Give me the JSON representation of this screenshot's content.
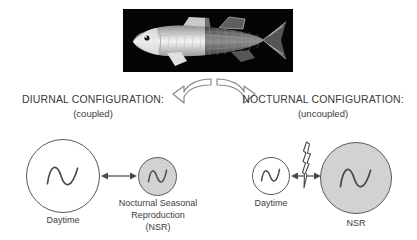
{
  "figure": {
    "photo": {
      "name": "fish-photograph",
      "alt": "Lateral view photograph of a fish on black background, left half lit, right half dark",
      "background_color": "#000000",
      "split": "left half bright (day), right half dark (night)"
    },
    "diverge_arrows": {
      "left_arrow_name": "curved-arrow-left",
      "right_arrow_name": "curved-arrow-right",
      "stroke_color": "#8a8a8a"
    },
    "panels": [
      {
        "id": "diurnal",
        "title": "DIURNAL CONFIGURATION:",
        "subtitle": "(coupled)",
        "coupling": "coupled",
        "oscillators": [
          {
            "id": "daytime",
            "caption": "Daytime",
            "size": "large",
            "fill": "#ffffff",
            "stroke": "#5a5a5a",
            "glyph": "wave"
          },
          {
            "id": "nsr",
            "caption": "Nocturnal Seasonal\nReproduction\n(NSR)",
            "caption_lines": [
              "Nocturnal Seasonal",
              "Reproduction",
              "(NSR)"
            ],
            "size": "small",
            "fill": "#d2d2d2",
            "stroke": "#5a5a5a",
            "glyph": "wave"
          }
        ],
        "connector": {
          "name": "double-headed-arrow",
          "type": "double-headed",
          "interrupted": false
        }
      },
      {
        "id": "nocturnal",
        "title": "NOCTURNAL CONFIGURATION:",
        "subtitle": "(uncoupled)",
        "coupling": "uncoupled",
        "oscillators": [
          {
            "id": "daytime",
            "caption": "Daytime",
            "size": "small",
            "fill": "#ffffff",
            "stroke": "#5a5a5a",
            "glyph": "wave"
          },
          {
            "id": "nsr",
            "caption": "NSR",
            "size": "large",
            "fill": "#d2d2d2",
            "stroke": "#5a5a5a",
            "glyph": "wave"
          }
        ],
        "connector": {
          "name": "broken-double-headed-arrow",
          "type": "double-headed",
          "interrupted": true,
          "break_symbol": "lightning-bolt"
        }
      }
    ]
  }
}
